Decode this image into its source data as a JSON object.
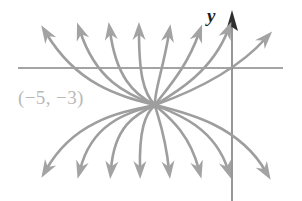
{
  "figure": {
    "kind": "phase-portrait",
    "background_color": "#ffffff",
    "curve_color": "#9e9e9e",
    "axis_color": "#4a4a4a",
    "label_color": "#b9b9b9",
    "axis_label_color": "#1e1e1e"
  },
  "axes": {
    "y_axis_label": "y",
    "x_axis": {
      "y_px": 68,
      "x_start_px": 18,
      "x_end_px": 283
    },
    "y_axis": {
      "x_px": 232,
      "y_top_px": 13,
      "y_bottom_px": 201
    }
  },
  "annotations": {
    "critical_point_label": "(−5, −3)",
    "critical_point_px": {
      "x": 155,
      "y": 105
    }
  },
  "chart_data": {
    "type": "line",
    "title": "",
    "xlabel": "",
    "ylabel": "y",
    "grid": false,
    "legend": null,
    "critical_point": [
      -5,
      -3
    ],
    "node_pixel": [
      155,
      105
    ],
    "upper_arrow_tips_px": [
      [
        42,
        26
      ],
      [
        77,
        24
      ],
      [
        107,
        24
      ],
      [
        137,
        24
      ],
      [
        168,
        26
      ],
      [
        198,
        26
      ],
      [
        228,
        22
      ],
      [
        265,
        30
      ]
    ],
    "lower_arrow_tips_px": [
      [
        42,
        178
      ],
      [
        77,
        178
      ],
      [
        107,
        178
      ],
      [
        137,
        178
      ],
      [
        168,
        178
      ],
      [
        198,
        178
      ],
      [
        228,
        178
      ],
      [
        265,
        180
      ]
    ],
    "series": [
      {
        "name": "upper-branch-1",
        "path": "M 155 105 C 120 96 78 86 46 33"
      },
      {
        "name": "upper-branch-2",
        "path": "M 155 105 C 126 94 96 80 80 31"
      },
      {
        "name": "upper-branch-3",
        "path": "M 155 105 C 133 94 116 76 110 31"
      },
      {
        "name": "upper-branch-4",
        "path": "M 155 105 C 143 93 139 72 139 31"
      },
      {
        "name": "upper-branch-5",
        "path": "M 155 105 C 154 92 163 70 169 33"
      },
      {
        "name": "upper-branch-6",
        "path": "M 155 105 C 164 92 186 70 199 33"
      },
      {
        "name": "upper-branch-7",
        "path": "M 155 105 C 175 93 212 72 228 30"
      },
      {
        "name": "upper-branch-8",
        "path": "M 155 105 C 183 95 234 74 266 38"
      },
      {
        "name": "lower-branch-1",
        "path": "M 155 105 C 122 112 74 120 46 170"
      },
      {
        "name": "lower-branch-2",
        "path": "M 155 105 C 128 113 92 122 80 170"
      },
      {
        "name": "lower-branch-3",
        "path": "M 155 105 C 136 114 114 126 111 170"
      },
      {
        "name": "lower-branch-4",
        "path": "M 155 105 C 145 114 139 130 140 170"
      },
      {
        "name": "lower-branch-5",
        "path": "M 155 105 C 157 115 165 132 169 170"
      },
      {
        "name": "lower-branch-6",
        "path": "M 155 105 C 166 115 189 131 199 170"
      },
      {
        "name": "lower-branch-7",
        "path": "M 155 105 C 178 114 215 128 228 170"
      },
      {
        "name": "lower-branch-8",
        "path": "M 155 105 C 188 113 240 126 266 172"
      }
    ]
  }
}
